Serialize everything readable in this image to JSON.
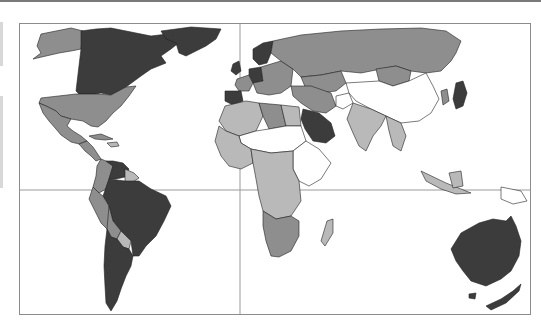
{
  "figure": {
    "type": "choropleth-world-map",
    "shading_levels": [
      {
        "name": "highest",
        "color": "#3c3c3c"
      },
      {
        "name": "high",
        "color": "#8e8e8e"
      },
      {
        "name": "medium",
        "color": "#b9b9b9"
      },
      {
        "name": "no-data",
        "color": "#ffffff"
      }
    ],
    "gridlines": {
      "equator_y": 189,
      "prime_meridian_x": 239
    },
    "regions": {
      "canada": "highest",
      "greenland": "highest",
      "alaska": "high",
      "united_states": "high",
      "mexico": "high",
      "central_america": "high",
      "caribbean": "high",
      "venezuela": "highest",
      "colombia": "high",
      "guianas": "medium",
      "brazil": "highest",
      "peru": "high",
      "bolivia": "high",
      "paraguay": "medium",
      "argentina": "highest",
      "chile": "highest",
      "uk": "highest",
      "france": "high",
      "spain": "highest",
      "germany": "highest",
      "scandinavia": "highest",
      "eastern_europe": "high",
      "russia": "high",
      "kazakhstan": "high",
      "mongolia": "high",
      "china": "no-data",
      "india": "medium",
      "southeast_asia": "medium",
      "japan": "highest",
      "korea": "high",
      "saudi_arabia": "highest",
      "iran": "high",
      "afghanistan": "no-data",
      "north_africa": "medium",
      "libya": "high",
      "egypt": "medium",
      "sahel": "no-data",
      "west_africa": "medium",
      "central_africa": "medium",
      "east_africa": "no-data",
      "southern_africa": "high",
      "madagascar": "medium",
      "indonesia": "medium",
      "papua_new_guinea": "no-data",
      "australia": "highest",
      "new_zealand": "highest"
    }
  }
}
